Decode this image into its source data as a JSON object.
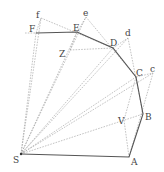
{
  "diagram": {
    "title": "",
    "points": {
      "S": {
        "label": "S",
        "x": 21,
        "y": 154,
        "lx": 13,
        "ly": 163
      },
      "A": {
        "label": "A",
        "x": 129,
        "y": 157,
        "lx": 131,
        "ly": 165
      },
      "B": {
        "label": "B",
        "x": 143,
        "y": 114,
        "lx": 145,
        "ly": 120
      },
      "C": {
        "label": "C",
        "x": 136,
        "y": 77,
        "lx": 136,
        "ly": 76
      },
      "D": {
        "label": "D",
        "x": 113,
        "y": 48,
        "lx": 110,
        "ly": 46
      },
      "E": {
        "label": "E",
        "x": 77,
        "y": 32,
        "lx": 73,
        "ly": 31
      },
      "F": {
        "label": "F",
        "x": 36,
        "y": 33,
        "lx": 29,
        "ly": 32
      },
      "f": {
        "label": "f",
        "x": 41,
        "y": 18,
        "lx": 36,
        "ly": 18
      },
      "e": {
        "label": "e",
        "x": 86,
        "y": 17,
        "lx": 83,
        "ly": 16
      },
      "d": {
        "label": "d",
        "x": 128,
        "y": 38,
        "lx": 125,
        "ly": 36
      },
      "c": {
        "label": "c",
        "x": 153,
        "y": 73,
        "lx": 150,
        "ly": 72
      },
      "V": {
        "label": "V",
        "x": 124,
        "y": 120,
        "lx": 118,
        "ly": 124
      },
      "Z": {
        "label": "Z",
        "x": 70,
        "y": 50,
        "lx": 59,
        "ly": 57
      }
    },
    "solid_polyline": [
      "S",
      "A",
      "B",
      "C",
      "D",
      "E",
      "F"
    ],
    "dashed_segments": [
      [
        "S",
        "f"
      ],
      [
        "S",
        "F"
      ],
      [
        "S",
        "e"
      ],
      [
        "S",
        "E"
      ],
      [
        "S",
        "D"
      ],
      [
        "S",
        "d"
      ],
      [
        "S",
        "C"
      ],
      [
        "S",
        "c"
      ],
      [
        "S",
        "B"
      ],
      [
        "F",
        "f"
      ],
      [
        "f",
        "D"
      ],
      [
        "E",
        "e"
      ],
      [
        "e",
        "C"
      ],
      [
        "D",
        "d"
      ],
      [
        "d",
        "B"
      ],
      [
        "C",
        "c"
      ],
      [
        "c",
        "A"
      ],
      [
        "C",
        "V"
      ],
      [
        "V",
        "A"
      ],
      [
        "Z",
        "D"
      ],
      [
        "Z",
        "E"
      ]
    ],
    "extension_line": {
      "from": [
        25,
        33
      ],
      "to": "F"
    }
  }
}
